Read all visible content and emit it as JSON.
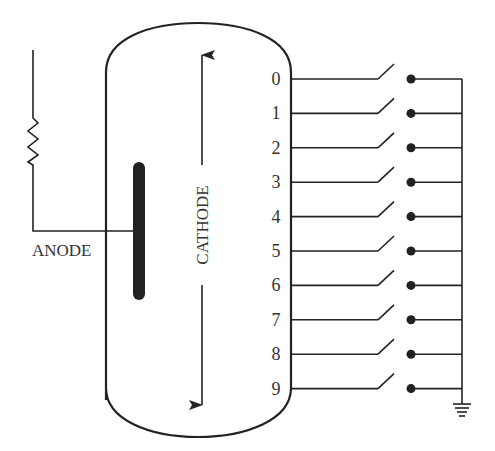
{
  "diagram": {
    "labels": {
      "anode": "ANODE",
      "cathode": "CATHODE"
    },
    "cathode_digits": [
      "0",
      "1",
      "2",
      "3",
      "4",
      "5",
      "6",
      "7",
      "8",
      "9"
    ],
    "components": {
      "resistor": "resistor",
      "ground": "ground",
      "switch": "switch"
    },
    "colors": {
      "line": "#222222",
      "text": "#333333",
      "background": "#ffffff"
    }
  }
}
